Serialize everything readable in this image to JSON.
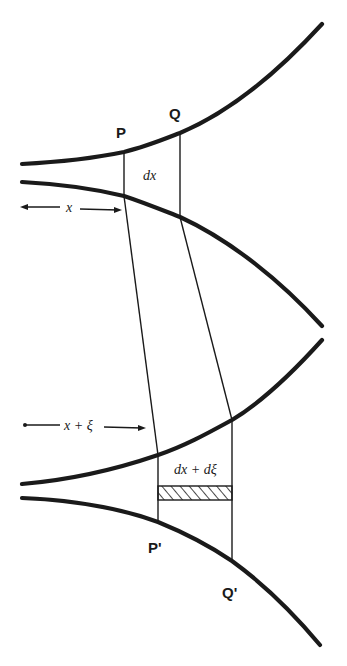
{
  "diagram": {
    "upper_figure": {
      "points": {
        "P": "P",
        "Q": "Q"
      },
      "element_label": "dx",
      "distance_label": "x"
    },
    "lower_figure": {
      "points": {
        "P_prime": "P'",
        "Q_prime": "Q'"
      },
      "element_label": "dx + dξ",
      "distance_label": "x + ξ"
    },
    "colors": {
      "ink": "#1a1a1a",
      "background": "#ffffff"
    }
  }
}
